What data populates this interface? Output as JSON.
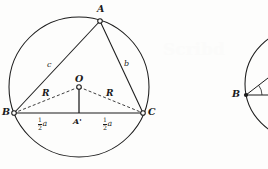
{
  "figure": {
    "caption_hidden": "",
    "background_color": "#fdfdfc",
    "ink_color": "#1b1b1b",
    "watermark_text": "Scribd"
  },
  "main_figure": {
    "name": "inscribed-triangle-circumcircle",
    "circle": {
      "cx": 79,
      "cy": 87,
      "r": 70
    },
    "points": {
      "A": {
        "x": 100,
        "y": 21,
        "label": "A",
        "marker": "open-circle"
      },
      "B": {
        "x": 14,
        "y": 113,
        "label": "B",
        "marker": "open-circle"
      },
      "C": {
        "x": 143,
        "y": 113,
        "label": "C",
        "marker": "open-circle"
      },
      "O": {
        "x": 79,
        "y": 87,
        "label": "O",
        "marker": "open-circle"
      },
      "Ap": {
        "x": 79,
        "y": 113,
        "label": "A'",
        "marker": "none"
      }
    },
    "labels": {
      "vertex_A": "A",
      "vertex_B": "B",
      "vertex_C": "C",
      "center_O": "O",
      "foot_Aprime": "A'",
      "side_c": "c",
      "side_b": "b",
      "radius_left": "R",
      "radius_right": "R"
    },
    "half_a_left": {
      "numerator": "1",
      "denominator": "2",
      "variable": "a"
    },
    "half_a_right": {
      "numerator": "1",
      "denominator": "2",
      "variable": "a"
    },
    "segments": {
      "AB": {
        "style": "solid",
        "label": "c"
      },
      "AC": {
        "style": "solid",
        "label": "b"
      },
      "BC": {
        "style": "solid",
        "label": "a"
      },
      "OB": {
        "style": "dashed",
        "label": "R"
      },
      "OC": {
        "style": "dashed",
        "label": "R"
      },
      "OAprime": {
        "style": "solid",
        "label": ""
      }
    }
  },
  "secondary_figure": {
    "name": "partial-circle-angle",
    "circle": {
      "cx": 300,
      "cy": 84,
      "r": 55
    },
    "points": {
      "B": {
        "x": 246,
        "y": 95,
        "label": "B",
        "marker": "filled-dot"
      }
    },
    "labels": {
      "vertex_B": "B"
    },
    "rays": 2,
    "angle_arc": true
  }
}
